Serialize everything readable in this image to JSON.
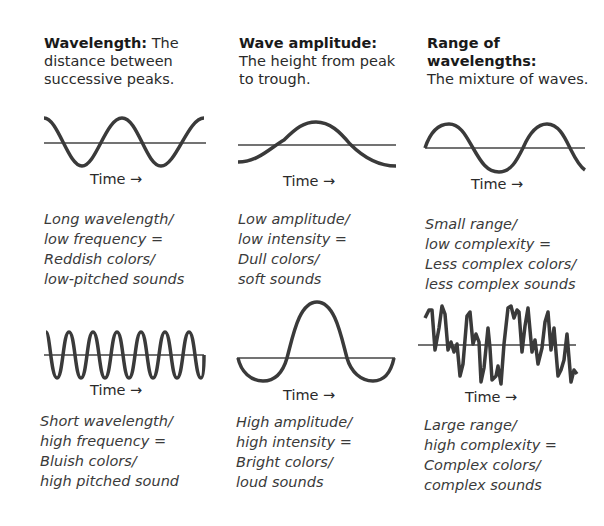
{
  "columns": [
    {
      "id": "wavelength",
      "title": "Wavelength:",
      "definition": " The distance between successive peaks.",
      "top_wave": {
        "label": "Time",
        "arrow": "→",
        "description": [
          "Long wavelength/",
          "low frequency =",
          "Reddish colors/",
          "low-pitched sounds"
        ]
      },
      "bottom_wave": {
        "label": "Time",
        "arrow": "→",
        "description": [
          "Short wavelength/",
          "high frequency =",
          "Bluish colors/",
          "high pitched sound"
        ]
      }
    },
    {
      "id": "amplitude",
      "title": "Wave amplitude:",
      "definition": " The height from peak to trough.",
      "top_wave": {
        "label": "Time",
        "arrow": "→",
        "description": [
          "Low amplitude/",
          "low intensity =",
          "Dull colors/",
          "soft sounds"
        ]
      },
      "bottom_wave": {
        "label": "Time",
        "arrow": "→",
        "description": [
          "High amplitude/",
          "high intensity =",
          "Bright colors/",
          "loud sounds"
        ]
      }
    },
    {
      "id": "range",
      "title": "Range of wavelengths:",
      "definition": "The mixture of waves.",
      "top_wave": {
        "label": "Time",
        "arrow": "→",
        "description": [
          "Small range/",
          "low complexity =",
          "Less complex colors/",
          "less complex sounds"
        ]
      },
      "bottom_wave": {
        "label": "Time",
        "arrow": "→",
        "description": [
          "Large range/",
          "high complexity =",
          "Complex colors/",
          "complex sounds"
        ]
      }
    }
  ],
  "colors": {
    "wave": "#3a3a3a",
    "axis": "#444444",
    "text": "#2a2a2a"
  }
}
